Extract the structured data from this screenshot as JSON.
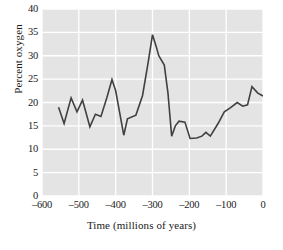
{
  "chart_data": {
    "type": "line",
    "title": "",
    "xlabel": "Time (millions of years)",
    "ylabel": "Percent oxygen",
    "xlim": [
      -600,
      0
    ],
    "ylim": [
      0,
      40
    ],
    "xticks": [
      -600,
      -500,
      -400,
      -300,
      -200,
      -100,
      0
    ],
    "xtick_labels": [
      "–600",
      "–500",
      "–400",
      "–300",
      "–200",
      "–100",
      "0"
    ],
    "yticks": [
      0,
      5,
      10,
      15,
      20,
      25,
      30,
      35,
      40
    ],
    "ytick_labels": [
      "0",
      "5",
      "10",
      "15",
      "20",
      "25",
      "30",
      "35",
      "40"
    ],
    "grid": true,
    "grid_color": "#ffffff",
    "plot_background": "#e4e4e4",
    "line_color": "#404040",
    "line_width": 1.6,
    "legend": null,
    "series": [
      {
        "name": "Atmospheric oxygen",
        "x": [
          -555,
          -540,
          -521,
          -505,
          -490,
          -470,
          -455,
          -440,
          -424,
          -410,
          -400,
          -378,
          -368,
          -345,
          -327,
          -312,
          -300,
          -290,
          -283,
          -268,
          -258,
          -248,
          -238,
          -228,
          -212,
          -198,
          -180,
          -166,
          -155,
          -143,
          -122,
          -105,
          -88,
          -70,
          -55,
          -42,
          -30,
          -14,
          0
        ],
        "y": [
          19.0,
          15.5,
          21.0,
          18.0,
          20.5,
          14.8,
          17.5,
          17.0,
          21.0,
          24.9,
          22.5,
          13.0,
          16.5,
          17.3,
          21.5,
          28.5,
          34.5,
          32.0,
          30.0,
          28.0,
          22.0,
          12.8,
          15.0,
          16.0,
          15.8,
          12.3,
          12.4,
          12.8,
          13.6,
          12.8,
          15.5,
          18.0,
          18.9,
          20.0,
          19.2,
          19.5,
          23.4,
          22.0,
          21.4
        ]
      }
    ]
  }
}
